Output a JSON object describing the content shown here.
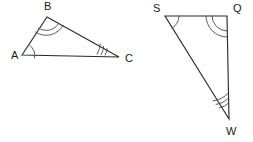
{
  "figure": {
    "stroke_color": "#2b2b2b",
    "arc_color": "#4a4a4a",
    "background": "#ffffff",
    "label_color": "#1a1a1a"
  },
  "triangles": [
    {
      "name": "ABC",
      "vertices": [
        {
          "label": "A",
          "x": 22,
          "y": 55,
          "label_x": 11,
          "label_y": 59,
          "arcs": 1
        },
        {
          "label": "B",
          "x": 47,
          "y": 17,
          "label_x": 44,
          "label_y": 10,
          "arcs": 2
        },
        {
          "label": "C",
          "x": 119,
          "y": 57,
          "label_x": 125,
          "label_y": 62,
          "arcs": 3
        }
      ]
    },
    {
      "name": "SQW",
      "vertices": [
        {
          "label": "S",
          "x": 165,
          "y": 16,
          "label_x": 153,
          "label_y": 12,
          "arcs": 1
        },
        {
          "label": "Q",
          "x": 227,
          "y": 16,
          "label_x": 233,
          "label_y": 12,
          "arcs": 2
        },
        {
          "label": "W",
          "x": 229,
          "y": 119,
          "label_x": 226,
          "label_y": 135,
          "arcs": 3
        }
      ]
    }
  ],
  "angle_marks": {
    "A": {
      "count": 1,
      "radii": [
        13
      ]
    },
    "B": {
      "count": 2,
      "radii": [
        14,
        19
      ]
    },
    "C": {
      "count": 3,
      "radii": [
        14,
        18,
        22
      ]
    },
    "S": {
      "count": 1,
      "radii": [
        14
      ]
    },
    "Q": {
      "count": 2,
      "radii": [
        15,
        21
      ]
    },
    "W": {
      "count": 3,
      "radii": [
        16,
        21,
        26
      ]
    }
  }
}
